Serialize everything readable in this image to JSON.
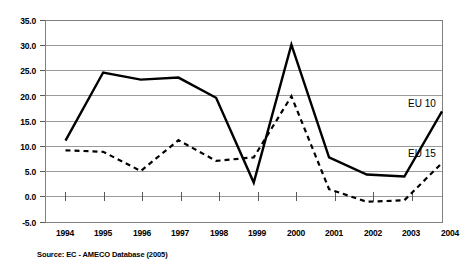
{
  "chart_data": {
    "type": "line",
    "title": "",
    "xlabel": "",
    "ylabel": "",
    "categories": [
      "1994",
      "1995",
      "1996",
      "1997",
      "1998",
      "1999",
      "2000",
      "2001",
      "2002",
      "2003",
      "2004"
    ],
    "x": [
      1994,
      1995,
      1996,
      1997,
      1998,
      1999,
      2000,
      2001,
      2002,
      2003,
      2004
    ],
    "ylim": [
      -5.0,
      35.0
    ],
    "xlim": [
      1994,
      2004
    ],
    "grid": true,
    "gridlines_axis": "y",
    "legend_position": "inline-right-of-series",
    "ytick_labels": [
      "35.0",
      "30.0",
      "25.0",
      "20.0",
      "15.0",
      "10.0",
      "5.0",
      "0.0",
      "-5.0"
    ],
    "ytick_values": [
      35.0,
      30.0,
      25.0,
      20.0,
      15.0,
      10.0,
      5.0,
      0.0,
      -5.0
    ],
    "series": [
      {
        "name": "EU 10",
        "style": "solid",
        "color": "#000000",
        "values": [
          11.2,
          24.7,
          23.3,
          23.7,
          19.7,
          2.9,
          30.2,
          7.9,
          4.5,
          4.1,
          17.0
        ]
      },
      {
        "name": "EU 15",
        "style": "dashed",
        "color": "#000000",
        "values": [
          9.3,
          9.0,
          5.2,
          11.3,
          7.2,
          7.9,
          20.0,
          1.6,
          -0.9,
          -0.6,
          6.8
        ]
      }
    ],
    "annotations": [
      {
        "text": "EU 10",
        "at_x": 2004,
        "at_y": 18.6
      },
      {
        "text": "EU 15",
        "at_x": 2004,
        "at_y": 8.6
      }
    ]
  },
  "source": {
    "note": "Source:  EC - AMECO Database (2005)"
  }
}
